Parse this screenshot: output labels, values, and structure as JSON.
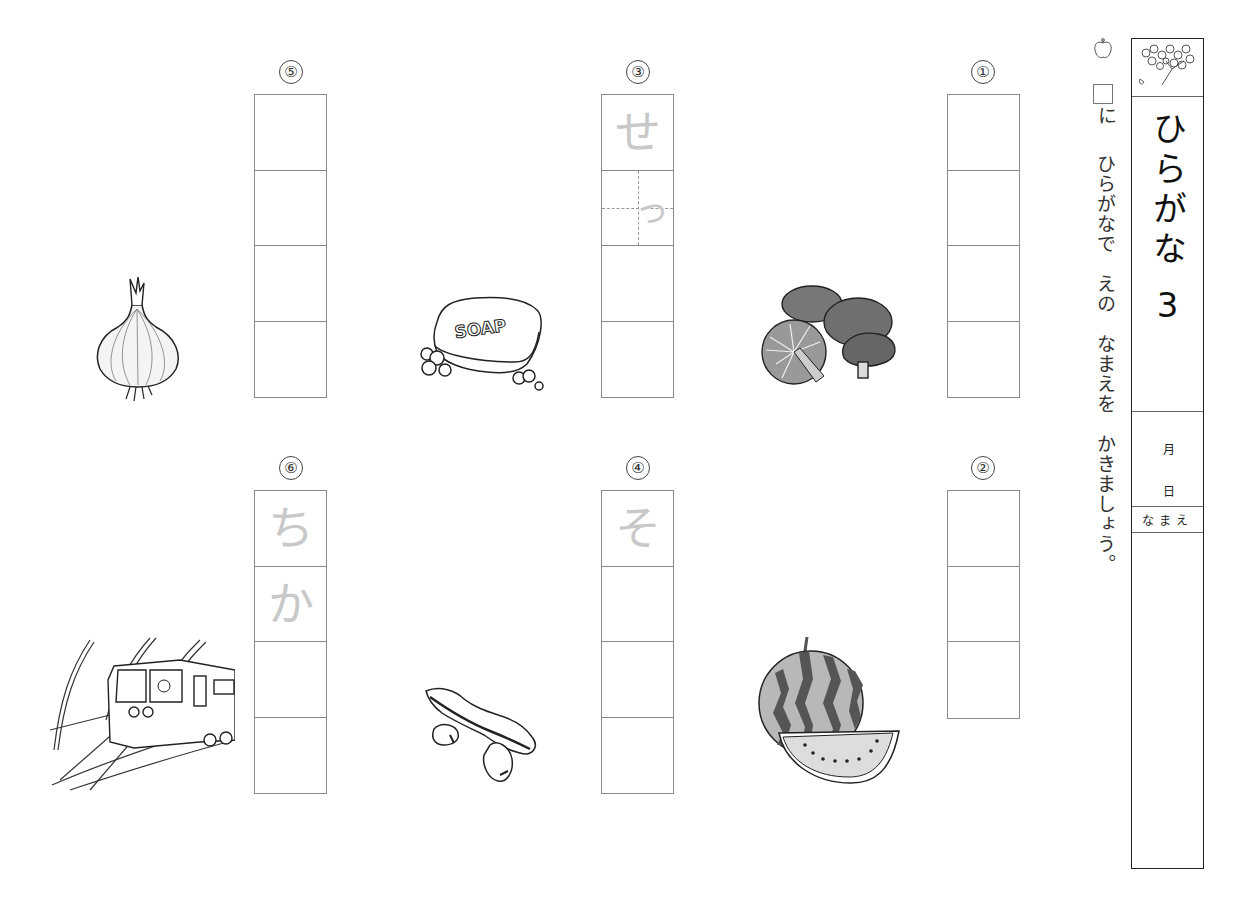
{
  "instructions": {
    "line1_suffix": "に",
    "line2": "ひらがなで　えの　なまえを　かきましょう。",
    "icon": "apple-icon"
  },
  "panel": {
    "title": "ひらがな",
    "number": "3",
    "month_label": "月",
    "day_label": "日",
    "name_label": "なまえ",
    "header_icon": "cherry-blossom-icon"
  },
  "problems": [
    {
      "number": "①",
      "picture": "mushrooms (shiitake)",
      "boxes": 4,
      "hints": []
    },
    {
      "number": "②",
      "picture": "watermelon",
      "boxes": 3,
      "hints": []
    },
    {
      "number": "③",
      "picture": "soap",
      "boxes": 4,
      "hints": [
        "せ",
        "っ"
      ]
    },
    {
      "number": "④",
      "picture": "broad beans (soramame)",
      "boxes": 4,
      "hints": [
        "そ"
      ]
    },
    {
      "number": "⑤",
      "picture": "onion",
      "boxes": 4,
      "hints": []
    },
    {
      "number": "⑥",
      "picture": "subway train",
      "boxes": 4,
      "hints": [
        "ち",
        "か"
      ]
    }
  ],
  "pictures": {
    "soap_label": "SOAP"
  }
}
